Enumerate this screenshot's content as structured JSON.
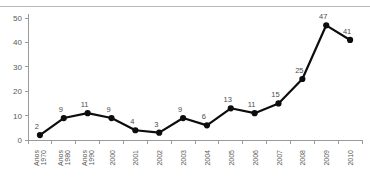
{
  "chart_data": {
    "type": "line",
    "title": "",
    "subtitle": "",
    "xlabel": "",
    "ylabel": "",
    "categories": [
      "Anos 1970",
      "Anos 1980",
      "Anos 1990",
      "2000",
      "2001",
      "2002",
      "2003",
      "2004",
      "2005",
      "2006",
      "2007",
      "2008",
      "2009",
      "2010"
    ],
    "values": [
      2,
      9,
      11,
      9,
      4,
      3,
      9,
      6,
      13,
      11,
      15,
      25,
      47,
      41
    ],
    "data_labels": [
      "2",
      "9",
      "11",
      "9",
      "4",
      "3",
      "9",
      "6",
      "13",
      "11",
      "15",
      "25",
      "47",
      "41"
    ],
    "ylim": [
      0,
      50
    ],
    "yticks": [
      0,
      10,
      20,
      30,
      40,
      50
    ],
    "ytick_labels": [
      "0",
      "10",
      "20",
      "30",
      "40",
      "50"
    ],
    "grid": false,
    "legend": null,
    "legend_position": "none",
    "marker": "filled-circle",
    "series_color": "#0d0d0d",
    "axis_color": "#9b9b9b",
    "label_color": "#595959",
    "background_color": "#ffffff"
  }
}
